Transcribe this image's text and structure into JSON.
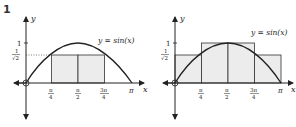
{
  "figure_number": "1",
  "panels": [
    {
      "id": "left",
      "title": "lower Riemann sum",
      "curve_label": "y = sin(x)",
      "x_axis_label": "x",
      "y_axis_label": "y",
      "x_ticks": [
        "π/4",
        "π/2",
        "3π/4",
        "π"
      ],
      "y_ticks": [
        "1",
        "1/√2"
      ],
      "rectangles": [
        {
          "x0": "π/4",
          "x1": "π/2",
          "height": "1/√2"
        },
        {
          "x0": "π/2",
          "x1": "3π/4",
          "height": "1/√2"
        }
      ],
      "dotted_guide": "y = 1/√2"
    },
    {
      "id": "right",
      "title": "upper Riemann sum",
      "curve_label": "y = sin(x)",
      "x_axis_label": "x",
      "y_axis_label": "y",
      "x_ticks": [
        "π/4",
        "π/2",
        "3π/4",
        "π"
      ],
      "y_ticks": [
        "1",
        "1/√2"
      ],
      "rectangles": [
        {
          "x0": "0",
          "x1": "π/4",
          "height": "1/√2"
        },
        {
          "x0": "π/4",
          "x1": "π/2",
          "height": "1"
        },
        {
          "x0": "π/2",
          "x1": "3π/4",
          "height": "1"
        },
        {
          "x0": "3π/4",
          "x1": "π",
          "height": "1/√2"
        }
      ]
    }
  ],
  "labels": {
    "y": "y",
    "x": "x",
    "curve": "y = sin(x)",
    "one": "1",
    "pi": "π",
    "pi_sym": "π",
    "four": "4",
    "two": "2",
    "three_pi": "3π",
    "root2": "√2"
  },
  "colors": {
    "fill": "#ececec",
    "stroke": "#222222"
  }
}
